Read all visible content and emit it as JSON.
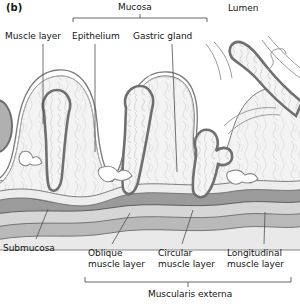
{
  "figure": {
    "panel_label": "(b)",
    "title_implicit": "Stomach wall histology cross-section",
    "brackets": {
      "mucosa": {
        "label": "Mucosa",
        "x1": 73,
        "x2": 207,
        "y": 18
      },
      "muscularis_externa": {
        "label": "Muscularis externa",
        "x1": 85,
        "x2": 291,
        "y": 281
      }
    },
    "labels": [
      {
        "key": "muscle_layer",
        "text": "Muscle layer",
        "x": 5,
        "y": 32,
        "align": "left"
      },
      {
        "key": "epithelium",
        "text": "Epithelium",
        "x": 73,
        "y": 32,
        "align": "left"
      },
      {
        "key": "gastric_gland",
        "text": "Gastric gland",
        "x": 133,
        "y": 32,
        "align": "left"
      },
      {
        "key": "lumen",
        "text": "Lumen",
        "x": 228,
        "y": 5,
        "align": "left"
      },
      {
        "key": "submucosa",
        "text": "Submucosa",
        "x": 3,
        "y": 244,
        "align": "left"
      },
      {
        "key": "oblique_muscle",
        "text": "Oblique\nmuscle layer",
        "x": 88,
        "y": 249,
        "align": "left"
      },
      {
        "key": "circular_muscle",
        "text": "Circular\nmuscle layer",
        "x": 158,
        "y": 249,
        "align": "left"
      },
      {
        "key": "longitudinal_muscle",
        "text": "Longitudinal\nmuscle layer",
        "x": 228,
        "y": 249,
        "align": "left"
      }
    ],
    "leaders": [
      {
        "key": "leader-muscle-layer",
        "x1": 43,
        "y1": 44,
        "x2": 43,
        "y2": 120
      },
      {
        "key": "leader-epithelium",
        "x1": 95,
        "y1": 44,
        "x2": 95,
        "y2": 150
      },
      {
        "key": "leader-gastric-gland",
        "x1": 172,
        "y1": 44,
        "x2": 176,
        "y2": 170
      },
      {
        "key": "leader-submucosa",
        "x1": 37,
        "y1": 238,
        "x2": 47,
        "y2": 211
      },
      {
        "key": "leader-oblique",
        "x1": 113,
        "y1": 243,
        "x2": 129,
        "y2": 215
      },
      {
        "key": "leader-circular",
        "x1": 183,
        "y1": 243,
        "x2": 193,
        "y2": 212
      },
      {
        "key": "leader-longitudinal",
        "x1": 265,
        "y1": 243,
        "x2": 265,
        "y2": 214
      }
    ],
    "colors": {
      "outline": "#4a4a4a",
      "epithelium_band": "#8c8c8c",
      "lamina_propria_fill": "#f1f1f1",
      "submucosa_fill": "#e8e8e8",
      "oblique_layer": "#9a9a9a",
      "circular_layer": "#d2d2d2",
      "longitudinal_layer": "#b5b5b5",
      "serosa": "#e2e2e2",
      "background": "#ffffff",
      "text": "#151515",
      "leader_line": "#555555"
    }
  }
}
